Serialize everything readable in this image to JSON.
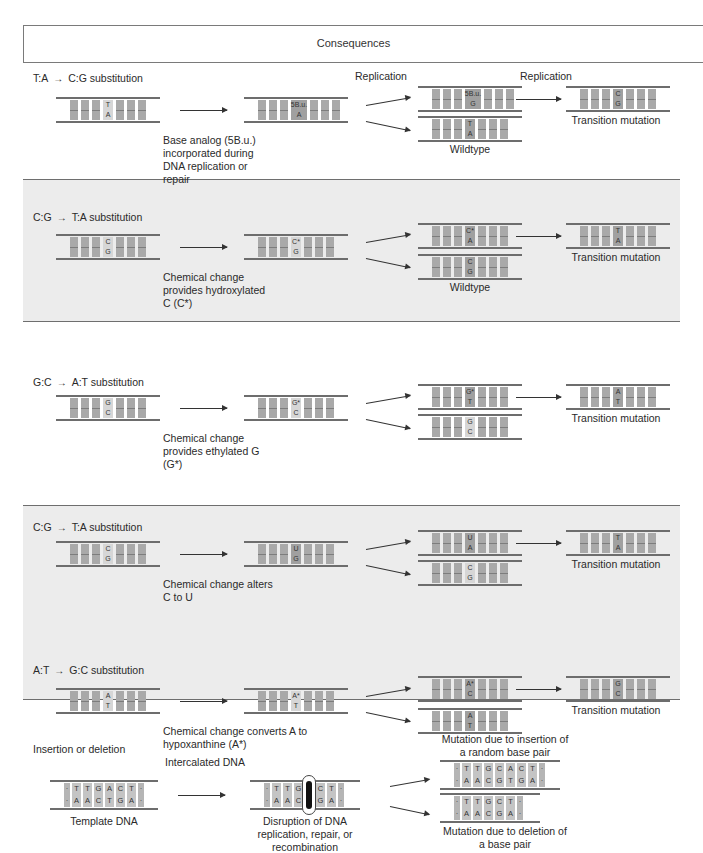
{
  "header": {
    "title": "Consequences"
  },
  "sections": [
    {
      "id": "ta-to-cg",
      "title_from": "T:A",
      "title_to": "C:G substitution",
      "replication_labels": [
        "Replication",
        "Replication"
      ],
      "step1": {
        "top": "T",
        "bottom": "A"
      },
      "step2": {
        "top": "5B.u.",
        "bottom": "A"
      },
      "step2_caption": "Base analog (5B.u.) incorporated during DNA replication or repair",
      "branch_top": {
        "top": "5B.u.",
        "bottom": "G"
      },
      "branch_bottom": {
        "top": "T",
        "bottom": "A"
      },
      "branch_bottom_caption": "Wildtype",
      "result": {
        "top": "C",
        "bottom": "G"
      },
      "result_caption": "Transition mutation"
    },
    {
      "id": "cg-to-ta-hydroxylated",
      "title_from": "C:G",
      "title_to": "T:A substitution",
      "step1": {
        "top": "C",
        "bottom": "G"
      },
      "step2": {
        "top": "C*",
        "bottom": "G"
      },
      "step2_caption": "Chemical change provides hydroxylated C (C*)",
      "branch_top": {
        "top": "C*",
        "bottom": "A"
      },
      "branch_bottom": {
        "top": "C",
        "bottom": "G"
      },
      "branch_bottom_caption": "Wildtype",
      "result": {
        "top": "T",
        "bottom": "A"
      },
      "result_caption": "Transition mutation"
    },
    {
      "id": "gc-to-at",
      "title_from": "G:C",
      "title_to": "A:T substitution",
      "step1": {
        "top": "G",
        "bottom": "C"
      },
      "step2": {
        "top": "G*",
        "bottom": "C"
      },
      "step2_caption": "Chemical change provides ethylated G (G*)",
      "branch_top": {
        "top": "G*",
        "bottom": "T"
      },
      "branch_bottom": {
        "top": "G",
        "bottom": "C"
      },
      "result": {
        "top": "A",
        "bottom": "T"
      },
      "result_caption": "Transition mutation"
    },
    {
      "id": "cg-to-ta-deamination",
      "title_from": "C:G",
      "title_to": "T:A substitution",
      "step1": {
        "top": "C",
        "bottom": "G"
      },
      "step2": {
        "top": "U",
        "bottom": "G"
      },
      "step2_caption": "Chemical change alters C to U",
      "branch_top": {
        "top": "U",
        "bottom": "A"
      },
      "branch_bottom": {
        "top": "C",
        "bottom": "G"
      },
      "result": {
        "top": "T",
        "bottom": "A"
      },
      "result_caption": "Transition mutation"
    },
    {
      "id": "at-to-gc",
      "title_from": "A:T",
      "title_to": "G:C substitution",
      "step1": {
        "top": "A",
        "bottom": "T"
      },
      "step2": {
        "top": "A*",
        "bottom": "T"
      },
      "step2_caption": "Chemical change converts A to hypoxanthine (A*)",
      "branch_top": {
        "top": "A*",
        "bottom": "C"
      },
      "branch_bottom": {
        "top": "A",
        "bottom": "T"
      },
      "result": {
        "top": "G",
        "bottom": "C"
      },
      "result_caption": "Transition mutation"
    }
  ],
  "indel": {
    "title": "Insertion or deletion",
    "arrow_label": "Intercalated DNA",
    "template": {
      "top": [
        "T",
        "T",
        "G",
        "A",
        "C",
        "T"
      ],
      "bottom": [
        "A",
        "A",
        "C",
        "T",
        "G",
        "A"
      ]
    },
    "template_caption": "Template DNA",
    "disrupted": {
      "top": [
        "T",
        "T",
        "G",
        "A",
        "C",
        "T"
      ],
      "bottom": [
        "A",
        "A",
        "C",
        "T",
        "G",
        "A"
      ]
    },
    "disrupted_caption": "Disruption of DNA replication, repair, or recombination",
    "insertion": {
      "top": [
        "T",
        "T",
        "G",
        "C",
        "A",
        "C",
        "T"
      ],
      "bottom": [
        "A",
        "A",
        "C",
        "G",
        "T",
        "G",
        "A"
      ]
    },
    "insertion_caption": "Mutation due to insertion of a random base pair",
    "deletion": {
      "top": [
        "T",
        "T",
        "G",
        "C",
        "T"
      ],
      "bottom": [
        "A",
        "A",
        "C",
        "G",
        "A"
      ]
    },
    "deletion_caption": "Mutation due to deletion of a base pair"
  },
  "arrow_symbol": "→"
}
